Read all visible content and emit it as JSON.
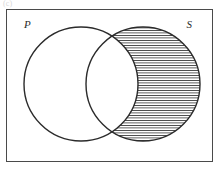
{
  "figure": {
    "caption": "(c)",
    "type": "venn-diagram",
    "background_color": "#ffffff",
    "stroke_color": "#2b2b2b"
  },
  "universal_set": {
    "name": "universal-set-rectangle",
    "x": 6,
    "y": 9,
    "width": 207,
    "height": 153,
    "stroke": "#4a4a4a",
    "stroke_width": 1,
    "fill": "#ffffff"
  },
  "sets": [
    {
      "label": "P",
      "name": "set-p",
      "cx": 81,
      "cy": 84,
      "r": 57,
      "shaded": false,
      "label_x": 24,
      "label_y": 28
    },
    {
      "label": "S",
      "name": "set-s",
      "cx": 143,
      "cy": 84,
      "r": 57,
      "shaded": true,
      "label_x": 192,
      "label_y": 28
    }
  ],
  "shading": {
    "region": "S \\ P",
    "pattern": "horizontal-lines",
    "line_spacing": 2.5,
    "line_width": 0.85,
    "line_color": "#3a3a3a",
    "fill_color": "#ffffff"
  },
  "intersection_points": {
    "top": {
      "x": 118,
      "y": 26
    },
    "bottom": {
      "x": 118,
      "y": 142
    }
  },
  "chart_data": {
    "type": "venn",
    "title": "",
    "sets": [
      "P",
      "S"
    ],
    "shaded_regions": [
      "S only"
    ],
    "unshaded_regions": [
      "P only",
      "P and S",
      "outside both"
    ],
    "set_radius": 57,
    "centers": [
      [
        81,
        84
      ],
      [
        143,
        84
      ]
    ],
    "legend": "none",
    "grid": false
  }
}
